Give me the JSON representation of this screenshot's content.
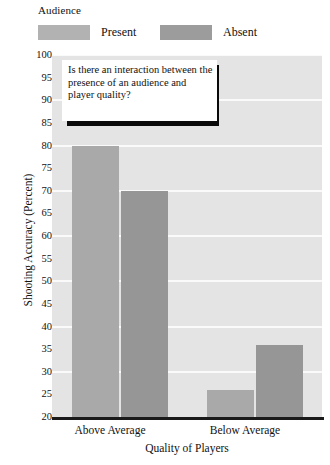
{
  "legend": {
    "title": "Audience",
    "entries": [
      {
        "label": "Present",
        "color": "#a9a9a9"
      },
      {
        "label": "Absent",
        "color": "#969696"
      }
    ]
  },
  "annotation": {
    "text": "Is there an interaction between the presence of an audience and player quality?"
  },
  "chart_data": {
    "type": "bar",
    "title": "",
    "xlabel": "Quality of Players",
    "ylabel": "Shooting Accuracy (Percent)",
    "categories": [
      "Above Average",
      "Below Average"
    ],
    "series": [
      {
        "name": "Present",
        "color": "#a9a9a9",
        "values": [
          80,
          26
        ]
      },
      {
        "name": "Absent",
        "color": "#969696",
        "values": [
          70,
          36
        ]
      }
    ],
    "ylim": [
      20,
      100
    ],
    "yticks": [
      100,
      95,
      90,
      85,
      80,
      75,
      70,
      65,
      60,
      55,
      50,
      45,
      40,
      35,
      30,
      25,
      20
    ],
    "gridlines": [
      100,
      90,
      80,
      70,
      60,
      50,
      40,
      30
    ],
    "grid": true,
    "legend_position": "top-left",
    "plot_background": "#e4e4e4",
    "gridline_color": "#fafafa"
  }
}
